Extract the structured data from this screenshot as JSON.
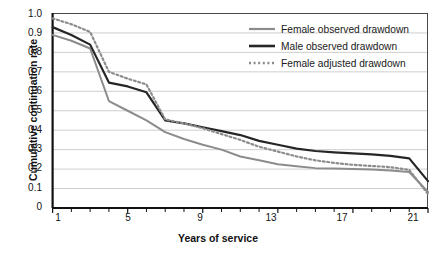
{
  "chart_data": {
    "type": "line",
    "title": "",
    "xlabel": "Years of service",
    "ylabel": "Cumulative continuation rate",
    "xlim": [
      1,
      21
    ],
    "ylim": [
      0,
      1.0
    ],
    "grid": true,
    "grid_axis": "y",
    "legend_position": "top-right",
    "x": [
      1,
      2,
      3,
      4,
      5,
      6,
      7,
      8,
      9,
      10,
      11,
      12,
      13,
      14,
      15,
      16,
      17,
      18,
      19,
      20,
      21
    ],
    "xticks": [
      1,
      5,
      9,
      13,
      17,
      21
    ],
    "xtick_labels": [
      "1",
      "5",
      "9",
      "13",
      "17",
      "21"
    ],
    "xticks_minor": [
      2,
      3,
      4,
      6,
      7,
      8,
      10,
      11,
      12,
      14,
      15,
      16,
      18,
      19,
      20
    ],
    "yticks": [
      0,
      0.1,
      0.2,
      0.3,
      0.4,
      0.5,
      0.6,
      0.7,
      0.8,
      0.9,
      1.0
    ],
    "ytick_labels": [
      "0",
      "0.1",
      "0.2",
      "0.3",
      "0.4",
      "0.5",
      "0.6",
      "0.7",
      "0.8",
      "0.9",
      "1.0"
    ],
    "series": [
      {
        "name": "Female observed drawdown",
        "color": "#8c8c8c",
        "style": "solid",
        "width": 2.0,
        "values": [
          0.89,
          0.86,
          0.82,
          0.55,
          0.5,
          0.45,
          0.39,
          0.355,
          0.325,
          0.3,
          0.265,
          0.245,
          0.225,
          0.215,
          0.205,
          0.203,
          0.2,
          0.198,
          0.196,
          0.193,
          0.185
        ]
      },
      {
        "name": "Male observed drawdown",
        "color": "#262626",
        "style": "solid",
        "width": 2.2,
        "values": [
          0.93,
          0.89,
          0.84,
          0.645,
          0.625,
          0.595,
          0.45,
          0.435,
          0.415,
          0.395,
          0.375,
          0.345,
          0.325,
          0.305,
          0.293,
          0.286,
          0.281,
          0.276,
          0.272,
          0.27,
          0.268
        ]
      },
      {
        "name": "Female adjusted drawdown",
        "color": "#8c8c8c",
        "style": "dotted",
        "width": 2.2,
        "values": [
          0.975,
          0.945,
          0.905,
          0.7,
          0.665,
          0.635,
          0.455,
          0.435,
          0.41,
          0.38,
          0.35,
          0.315,
          0.29,
          0.265,
          0.245,
          0.232,
          0.222,
          0.216,
          0.212,
          0.21,
          0.208
        ]
      }
    ],
    "series_tail": {
      "note": "all series drop steeply after year 19",
      "female_observed": {
        "x": [
          19,
          20,
          21
        ],
        "y": [
          0.193,
          0.185,
          0.082
        ]
      },
      "male_observed": {
        "x": [
          19,
          20,
          21
        ],
        "y": [
          0.268,
          0.255,
          0.138
        ]
      },
      "female_adjusted": {
        "x": [
          19,
          20,
          21
        ],
        "y": [
          0.21,
          0.196,
          0.072
        ]
      }
    }
  },
  "legend": {
    "items": [
      {
        "label": "Female observed drawdown",
        "color": "#8c8c8c",
        "style": "solid"
      },
      {
        "label": "Male observed drawdown",
        "color": "#262626",
        "style": "solid"
      },
      {
        "label": "Female adjusted drawdown",
        "color": "#8c8c8c",
        "style": "dotted"
      }
    ]
  },
  "axes": {
    "y_title": "Cumulative continuation rate",
    "x_title": "Years of service",
    "y_labels": [
      "1.0",
      "0.9",
      "0.8",
      "0.7",
      "0.6",
      "0.5",
      "0.4",
      "0.3",
      "0.2",
      "0.1",
      "0"
    ],
    "x_labels": [
      "1",
      "5",
      "9",
      "13",
      "17",
      "21"
    ]
  },
  "colors": {
    "gray_series": "#8c8c8c",
    "black_series": "#262626",
    "grid": "#c8c8c8",
    "axis": "#111111",
    "background": "#ffffff"
  }
}
